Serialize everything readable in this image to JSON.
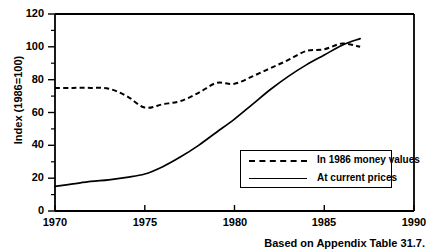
{
  "chart_data": {
    "type": "line",
    "title": "",
    "xlabel": "",
    "ylabel": "Index (1986=100)",
    "xlim": [
      1970,
      1990
    ],
    "ylim": [
      0,
      120
    ],
    "xticks": [
      1970,
      1975,
      1980,
      1985,
      1990
    ],
    "yticks": [
      0,
      20,
      40,
      60,
      80,
      100,
      120
    ],
    "grid": false,
    "legend_position": "inside-lower-right",
    "caption": "Based on Appendix Table 31.7.",
    "x": [
      1970,
      1971,
      1972,
      1973,
      1974,
      1975,
      1976,
      1977,
      1978,
      1979,
      1980,
      1981,
      1982,
      1983,
      1984,
      1985,
      1986,
      1987
    ],
    "series": [
      {
        "name": "In 1986 money values",
        "style": "dashed",
        "color": "#000000",
        "values": [
          75,
          75,
          75,
          74.5,
          70,
          63,
          65,
          67,
          72,
          78,
          77.5,
          82,
          87,
          92,
          97.5,
          98.5,
          102,
          100
        ]
      },
      {
        "name": "At current prices",
        "style": "solid",
        "color": "#000000",
        "values": [
          15,
          16.5,
          18,
          19,
          20.5,
          22.5,
          27,
          33,
          40,
          48,
          56,
          65,
          74,
          82,
          89,
          95,
          101,
          105
        ]
      }
    ]
  },
  "axis": {
    "y_title": "Index (1986=100)",
    "y_tick_labels": [
      "0",
      "20",
      "40",
      "60",
      "80",
      "100",
      "120"
    ],
    "x_tick_labels": [
      "1970",
      "1975",
      "1980",
      "1985",
      "1990"
    ]
  },
  "legend": {
    "entries": [
      {
        "label": "In 1986 money values",
        "style": "dashed"
      },
      {
        "label": "At current prices",
        "style": "solid"
      }
    ]
  },
  "footer": {
    "source_note": "Based on Appendix Table 31.7."
  }
}
